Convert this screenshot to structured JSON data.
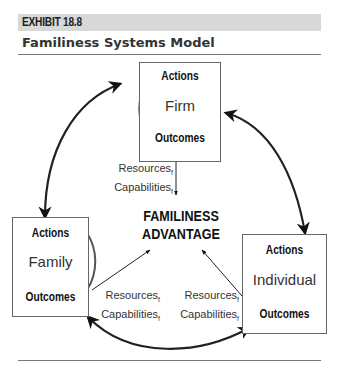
{
  "exhibit": {
    "label": "EXHIBIT 18.8",
    "title": "Familiness Systems Model"
  },
  "nodes": {
    "firm": {
      "name": "Firm",
      "top": "Actions",
      "bottom": "Outcomes"
    },
    "family": {
      "name": "Family",
      "top": "Actions",
      "bottom": "Outcomes"
    },
    "individual": {
      "name": "Individual",
      "top": "Actions",
      "bottom": "Outcomes"
    }
  },
  "center": {
    "line1": "FAMILINESS",
    "line2": "ADVANTAGE"
  },
  "flows": {
    "firm": {
      "resources": "Resources",
      "capabilities": "Capabilities",
      "subscript": "f"
    },
    "family": {
      "resources": "Resources",
      "capabilities": "Capabilities",
      "subscript": "f"
    },
    "individual": {
      "resources": "Resources",
      "capabilities": "Capabilities",
      "subscript": "f"
    }
  },
  "colors": {
    "header_bar": "#d8d8d8",
    "ink": "#111111",
    "box_border": "#666666"
  }
}
